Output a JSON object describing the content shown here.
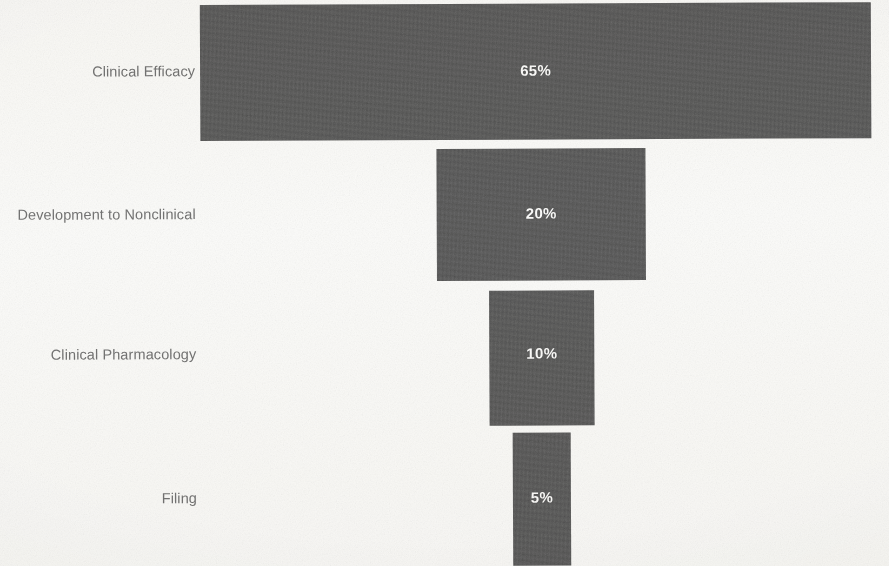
{
  "chart_data": {
    "type": "bar",
    "title": "",
    "subtitle": "",
    "xlabel": "",
    "ylabel": "",
    "orientation": "horizontal-funnel",
    "grid": false,
    "legend": "none",
    "value_unit": "%",
    "categories": [
      "Clinical Efficacy",
      "Development to Nonclinical",
      "Clinical Pharmacology",
      "Filing"
    ],
    "values": [
      65,
      20,
      10,
      5
    ],
    "value_labels": [
      "65%",
      "20%",
      "10%",
      "5%"
    ],
    "colors": {
      "bar_fill": "#555555",
      "value_text": "#ffffff",
      "category_text": "#6f6f6f",
      "background": "#fdfdfc"
    },
    "stages": [
      {
        "label": "Clinical Efficacy",
        "value": 65,
        "value_label": "65%",
        "geometry": {
          "left": 201,
          "top": 4,
          "width": 671,
          "height": 136
        },
        "label_geometry": {
          "right_edge": 196,
          "center_y": 72
        }
      },
      {
        "label": "Development to Nonclinical",
        "value": 20,
        "value_label": "20%",
        "geometry": {
          "left": 437,
          "top": 149,
          "width": 209,
          "height": 132
        },
        "label_geometry": {
          "right_edge": 196,
          "center_y": 215
        }
      },
      {
        "label": "Clinical Pharmacology",
        "value": 10,
        "value_label": "10%",
        "geometry": {
          "left": 489,
          "top": 291,
          "width": 105,
          "height": 135
        },
        "label_geometry": {
          "right_edge": 196,
          "center_y": 355
        }
      },
      {
        "label": "Filing",
        "value": 5,
        "value_label": "5%",
        "geometry": {
          "left": 512,
          "top": 433,
          "width": 58,
          "height": 133
        },
        "label_geometry": {
          "right_edge": 196,
          "center_y": 499
        }
      }
    ]
  }
}
